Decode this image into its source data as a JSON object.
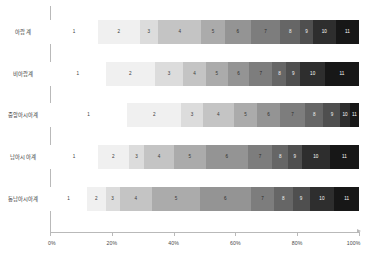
{
  "chart_data": {
    "type": "bar",
    "orientation": "horizontal",
    "stacked": true,
    "normalized": "100%",
    "title": "",
    "xlabel": "",
    "ylabel": "",
    "xlim": [
      0,
      100
    ],
    "grid": false,
    "legend": "none",
    "axis": {
      "ticks": [
        0,
        20,
        40,
        60,
        80,
        100
      ],
      "tick_labels": [
        "0%",
        "20%",
        "40%",
        "60%",
        "80%",
        "100%"
      ]
    },
    "segment_labels": [
      "1",
      "2",
      "3",
      "4",
      "5",
      "6",
      "7",
      "8",
      "9",
      "10",
      "11"
    ],
    "segment_colors": [
      "#ffffff",
      "#f0f0f0",
      "#dcdcdc",
      "#c4c4c4",
      "#ababab",
      "#949494",
      "#7d7d7d",
      "#666666",
      "#4f4f4f",
      "#2e2e2e",
      "#171717"
    ],
    "segment_text_colors": [
      "#3a3a3a",
      "#3a3a3a",
      "#3a3a3a",
      "#3a3a3a",
      "#3a3a3a",
      "#2b2b2b",
      "#2b2b2b",
      "#f2f2f2",
      "#f2f2f2",
      "#ffffff",
      "#ffffff"
    ],
    "categories": [
      "아랍계",
      "비아랍계",
      "중앙아시아계",
      "남아시아계",
      "동남아시아계"
    ],
    "series": [
      {
        "name": "1",
        "values": [
          15.5,
          18.0,
          25.0,
          15.5,
          12.0
        ]
      },
      {
        "name": "2",
        "values": [
          13.5,
          16.0,
          17.5,
          10.0,
          6.0
        ]
      },
      {
        "name": "3",
        "values": [
          6.0,
          9.0,
          7.0,
          5.0,
          4.5
        ]
      },
      {
        "name": "4",
        "values": [
          14.0,
          7.5,
          10.0,
          9.5,
          10.5
        ]
      },
      {
        "name": "5",
        "values": [
          7.5,
          7.0,
          7.5,
          10.5,
          15.5
        ]
      },
      {
        "name": "6",
        "values": [
          8.5,
          7.0,
          7.5,
          13.5,
          16.5
        ]
      },
      {
        "name": "7",
        "values": [
          9.5,
          7.5,
          8.0,
          8.0,
          7.5
        ]
      },
      {
        "name": "8",
        "values": [
          6.5,
          4.5,
          6.0,
          5.0,
          6.0
        ]
      },
      {
        "name": "9",
        "values": [
          4.0,
          4.5,
          5.5,
          4.5,
          5.5
        ]
      },
      {
        "name": "10",
        "values": [
          7.5,
          8.0,
          3.0,
          9.0,
          8.0
        ]
      },
      {
        "name": "11",
        "values": [
          7.5,
          11.0,
          3.0,
          9.5,
          8.0
        ]
      }
    ]
  }
}
